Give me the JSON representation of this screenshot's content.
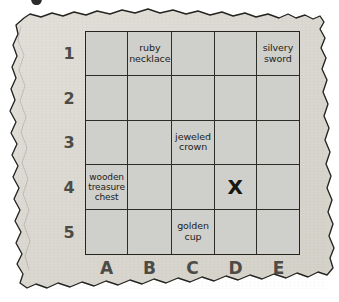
{
  "page": {
    "kind": "treasure-map-grid",
    "paper_color": "#dedbd4",
    "cell_color": "#cfcfcb",
    "ink_color": "#25241f",
    "axis_label_color": "#4c4b46"
  },
  "top_partial_mark": {
    "name": "cut-off-glyph",
    "text": ""
  },
  "grid": {
    "columns": [
      "A",
      "B",
      "C",
      "D",
      "E"
    ],
    "rows": [
      "1",
      "2",
      "3",
      "4",
      "5"
    ],
    "cells": [
      {
        "id": "A1",
        "col": "A",
        "row": "1",
        "text": "",
        "mark": ""
      },
      {
        "id": "B1",
        "col": "B",
        "row": "1",
        "text": "ruby necklace",
        "mark": ""
      },
      {
        "id": "C1",
        "col": "C",
        "row": "1",
        "text": "",
        "mark": ""
      },
      {
        "id": "D1",
        "col": "D",
        "row": "1",
        "text": "",
        "mark": ""
      },
      {
        "id": "E1",
        "col": "E",
        "row": "1",
        "text": "silvery sword",
        "mark": ""
      },
      {
        "id": "A2",
        "col": "A",
        "row": "2",
        "text": "",
        "mark": ""
      },
      {
        "id": "B2",
        "col": "B",
        "row": "2",
        "text": "",
        "mark": ""
      },
      {
        "id": "C2",
        "col": "C",
        "row": "2",
        "text": "",
        "mark": ""
      },
      {
        "id": "D2",
        "col": "D",
        "row": "2",
        "text": "",
        "mark": ""
      },
      {
        "id": "E2",
        "col": "E",
        "row": "2",
        "text": "",
        "mark": ""
      },
      {
        "id": "A3",
        "col": "A",
        "row": "3",
        "text": "",
        "mark": ""
      },
      {
        "id": "B3",
        "col": "B",
        "row": "3",
        "text": "",
        "mark": ""
      },
      {
        "id": "C3",
        "col": "C",
        "row": "3",
        "text": "jeweled crown",
        "mark": ""
      },
      {
        "id": "D3",
        "col": "D",
        "row": "3",
        "text": "",
        "mark": ""
      },
      {
        "id": "E3",
        "col": "E",
        "row": "3",
        "text": "",
        "mark": ""
      },
      {
        "id": "A4",
        "col": "A",
        "row": "4",
        "text": "wooden treasure chest",
        "mark": ""
      },
      {
        "id": "B4",
        "col": "B",
        "row": "4",
        "text": "",
        "mark": ""
      },
      {
        "id": "C4",
        "col": "C",
        "row": "4",
        "text": "",
        "mark": ""
      },
      {
        "id": "D4",
        "col": "D",
        "row": "4",
        "text": "",
        "mark": "X"
      },
      {
        "id": "E4",
        "col": "E",
        "row": "4",
        "text": "",
        "mark": ""
      },
      {
        "id": "A5",
        "col": "A",
        "row": "5",
        "text": "",
        "mark": ""
      },
      {
        "id": "B5",
        "col": "B",
        "row": "5",
        "text": "",
        "mark": ""
      },
      {
        "id": "C5",
        "col": "C",
        "row": "5",
        "text": "golden cup",
        "mark": ""
      },
      {
        "id": "D5",
        "col": "D",
        "row": "5",
        "text": "",
        "mark": ""
      },
      {
        "id": "E5",
        "col": "E",
        "row": "5",
        "text": "",
        "mark": ""
      }
    ]
  }
}
